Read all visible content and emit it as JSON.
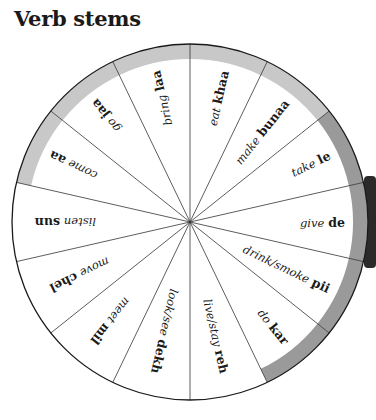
{
  "title": "Verb stems",
  "colors": {
    "ring_light": "#c8c8c8",
    "ring_dark": "#9a9a9a",
    "spoke": "#333333",
    "outline": "#1a1a1a"
  },
  "segments": [
    {
      "gloss": "listen",
      "stem": "sun",
      "ring": "none"
    },
    {
      "gloss": "come",
      "stem": "aa",
      "ring": "light"
    },
    {
      "gloss": "go",
      "stem": "jaa",
      "ring": "light"
    },
    {
      "gloss": "bring",
      "stem": "laa",
      "ring": "light"
    },
    {
      "gloss": "eat",
      "stem": "khaa",
      "ring": "light"
    },
    {
      "gloss": "make",
      "stem": "bunaa",
      "ring": "light"
    },
    {
      "gloss": "take",
      "stem": "le",
      "ring": "dark"
    },
    {
      "gloss": "give",
      "stem": "de",
      "ring": "dark"
    },
    {
      "gloss": "drink/smoke",
      "stem": "pii",
      "ring": "dark"
    },
    {
      "gloss": "do",
      "stem": "kar",
      "ring": "dark"
    },
    {
      "gloss": "live/stay",
      "stem": "reh",
      "ring": "none"
    },
    {
      "gloss": "look/see",
      "stem": "dekh",
      "ring": "none"
    },
    {
      "gloss": "meet",
      "stem": "mil",
      "ring": "none"
    },
    {
      "gloss": "move",
      "stem": "chel",
      "ring": "none"
    }
  ]
}
